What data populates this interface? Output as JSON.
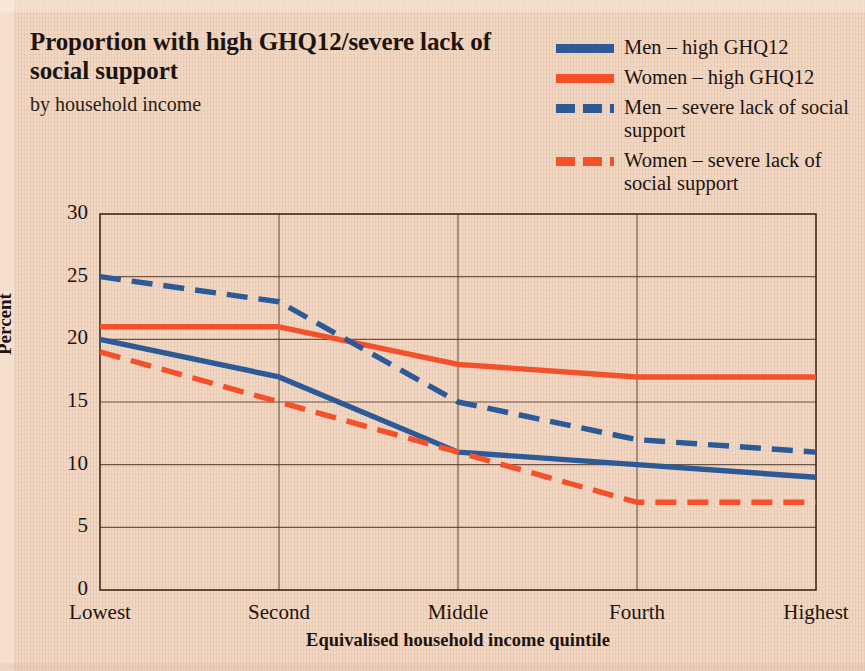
{
  "figure": {
    "background_color": "#f2d7c2",
    "title": "Proportion with high GHQ12/severe lack of",
    "title_line2": "social support",
    "subtitle": "by household income"
  },
  "legend": {
    "position": "top-right",
    "items": [
      {
        "label": "Men – high GHQ12",
        "color": "#2c5a96",
        "style": "solid"
      },
      {
        "label": "Women – high GHQ12",
        "color": "#f4502a",
        "style": "solid"
      },
      {
        "label": "Men – severe lack of social support",
        "color": "#2c5a96",
        "style": "dashed"
      },
      {
        "label": "Women – severe lack of social support",
        "color": "#f4502a",
        "style": "dashed"
      }
    ]
  },
  "axes": {
    "y_title": "Percent",
    "x_title": "Equivalised household income quintile",
    "y_ticks": [
      "0",
      "5",
      "10",
      "15",
      "20",
      "25",
      "30"
    ],
    "x_ticks": [
      "Lowest",
      "Second",
      "Middle",
      "Fourth",
      "Highest"
    ]
  },
  "chart_data": {
    "type": "line",
    "title": "Proportion with high GHQ12/severe lack of social support",
    "subtitle": "by household income",
    "xlabel": "Equivalised household income quintile",
    "ylabel": "Percent",
    "categories": [
      "Lowest",
      "Second",
      "Middle",
      "Fourth",
      "Highest"
    ],
    "ylim": [
      0,
      30
    ],
    "ytick_step": 5,
    "grid": true,
    "legend_position": "top-right",
    "series": [
      {
        "name": "Men – high GHQ12",
        "color": "#2c5a96",
        "style": "solid",
        "values": [
          20,
          17,
          11,
          10,
          9
        ]
      },
      {
        "name": "Women – high GHQ12",
        "color": "#f4502a",
        "style": "solid",
        "values": [
          21,
          21,
          18,
          17,
          17
        ]
      },
      {
        "name": "Men – severe lack of social support",
        "color": "#2c5a96",
        "style": "dashed",
        "values": [
          25,
          23,
          15,
          12,
          11
        ]
      },
      {
        "name": "Women – severe lack of social support",
        "color": "#f4502a",
        "style": "dashed",
        "values": [
          19,
          15,
          11,
          7,
          7
        ]
      }
    ]
  }
}
